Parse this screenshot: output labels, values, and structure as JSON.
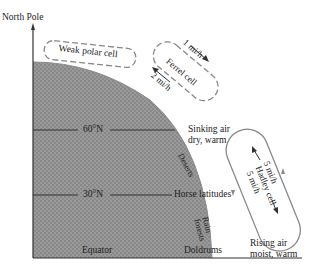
{
  "diagram": {
    "title_label": "North Pole",
    "latitudes": [
      {
        "label": "60°N",
        "side_label": "Sinking air",
        "side_label2": "dry, warm"
      },
      {
        "label": "30°N",
        "side_label": "Horse latitudes"
      },
      {
        "label": "Equator",
        "side_label": "Doldrums"
      }
    ],
    "cells": {
      "polar": {
        "name": "Weak polar cell"
      },
      "ferrel": {
        "name": "Ferrel cell",
        "upper_speed": "1 mi/h",
        "lower_speed": "2 mi/h"
      },
      "hadley": {
        "name": "Hadley cell",
        "upper_speed": "5 mi/h",
        "lower_speed": "5 mi/h"
      }
    },
    "surface_labels": {
      "deserts": "Deserts",
      "rain_forests_1": "Rain",
      "rain_forests_2": "forests"
    },
    "equator_note": {
      "line1": "Rising air",
      "line2": "moist, warm"
    },
    "colors": {
      "earth_fill": "#8f8f8f",
      "line": "#333333",
      "cell_outline": "#888888"
    }
  }
}
